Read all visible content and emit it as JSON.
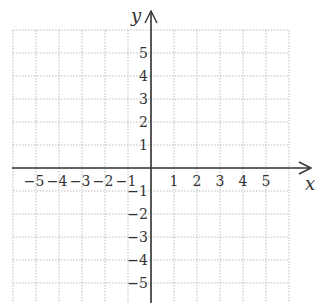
{
  "diagram": {
    "type": "coordinate-plane",
    "x_axis_label": "x",
    "y_axis_label": "y",
    "x_range": [
      -6,
      6
    ],
    "y_range": [
      -6,
      6
    ],
    "grid": "dotted",
    "grid_color": "#bbbbbb",
    "axis_color": "#333333",
    "x_ticks": [
      {
        "value": -5,
        "label": "−5"
      },
      {
        "value": -4,
        "label": "−4"
      },
      {
        "value": -3,
        "label": "−3"
      },
      {
        "value": -2,
        "label": "−2"
      },
      {
        "value": -1,
        "label": "−1"
      },
      {
        "value": 1,
        "label": "1"
      },
      {
        "value": 2,
        "label": "2"
      },
      {
        "value": 3,
        "label": "3"
      },
      {
        "value": 4,
        "label": "4"
      },
      {
        "value": 5,
        "label": "5"
      }
    ],
    "y_ticks": [
      {
        "value": 5,
        "label": "5"
      },
      {
        "value": 4,
        "label": "4"
      },
      {
        "value": 3,
        "label": "3"
      },
      {
        "value": 2,
        "label": "2"
      },
      {
        "value": 1,
        "label": "1"
      },
      {
        "value": -1,
        "label": "−1"
      },
      {
        "value": -2,
        "label": "−2"
      },
      {
        "value": -3,
        "label": "−3"
      },
      {
        "value": -4,
        "label": "−4"
      },
      {
        "value": -5,
        "label": "−5"
      }
    ]
  }
}
